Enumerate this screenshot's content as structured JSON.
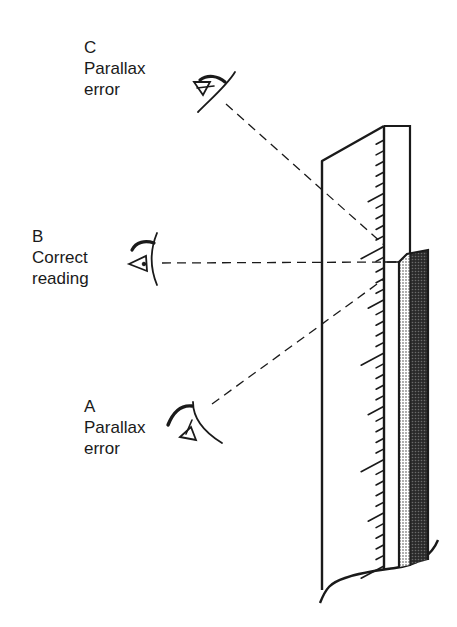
{
  "figure": {
    "labels": {
      "c": {
        "letter": "C",
        "line1": "Parallax",
        "line2": "error"
      },
      "b": {
        "letter": "B",
        "line1": "Correct",
        "line2": "reading"
      },
      "a": {
        "letter": "A",
        "line1": "Parallax",
        "line2": "error"
      }
    },
    "icons": {
      "eye_c": "eye-looking-down-icon",
      "eye_b": "eye-level-icon",
      "eye_a": "eye-looking-up-icon"
    },
    "colors": {
      "ink": "#1a1a1a",
      "liquid_light": "#c8c8c8",
      "liquid_dark": "#3a3a3a",
      "background": "#ffffff"
    }
  }
}
